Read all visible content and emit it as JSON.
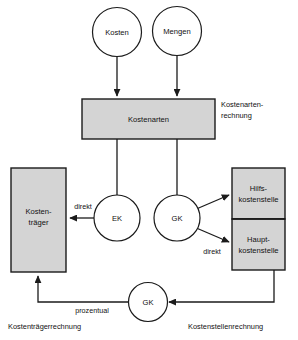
{
  "diagram": {
    "background_color": "#ffffff",
    "node_fill_grey": "#d4d4d4",
    "node_fill_white": "#ffffff",
    "stroke_color": "#1b1b1b",
    "nodes": {
      "kosten_circle": "Kosten",
      "mengen_circle": "Mengen",
      "kostenarten_box": "Kostenarten",
      "kostentraeger_box_line1": "Kosten-",
      "kostentraeger_box_line2": "träger",
      "ek_circle": "EK",
      "gk_circle_mid": "GK",
      "gk_circle_bottom": "GK",
      "hilfskostenstelle_line1": "Hilfs-",
      "hilfskostenstelle_line2": "kostenstelle",
      "hauptkostenstelle_line1": "Haupt-",
      "hauptkostenstelle_line2": "kostenstelle"
    },
    "edge_labels": {
      "direkt_left": "direkt",
      "direkt_right": "direkt",
      "prozentual": "prozentual"
    },
    "side_labels": {
      "kostenartenrechnung_line1": "Kostenarten-",
      "kostenartenrechnung_line2": "rechnung"
    },
    "captions": {
      "kostentraegerrechnung": "Kostenträgerrechnung",
      "kostenstellenrechnung": "Kostenstellenrechnung"
    }
  }
}
